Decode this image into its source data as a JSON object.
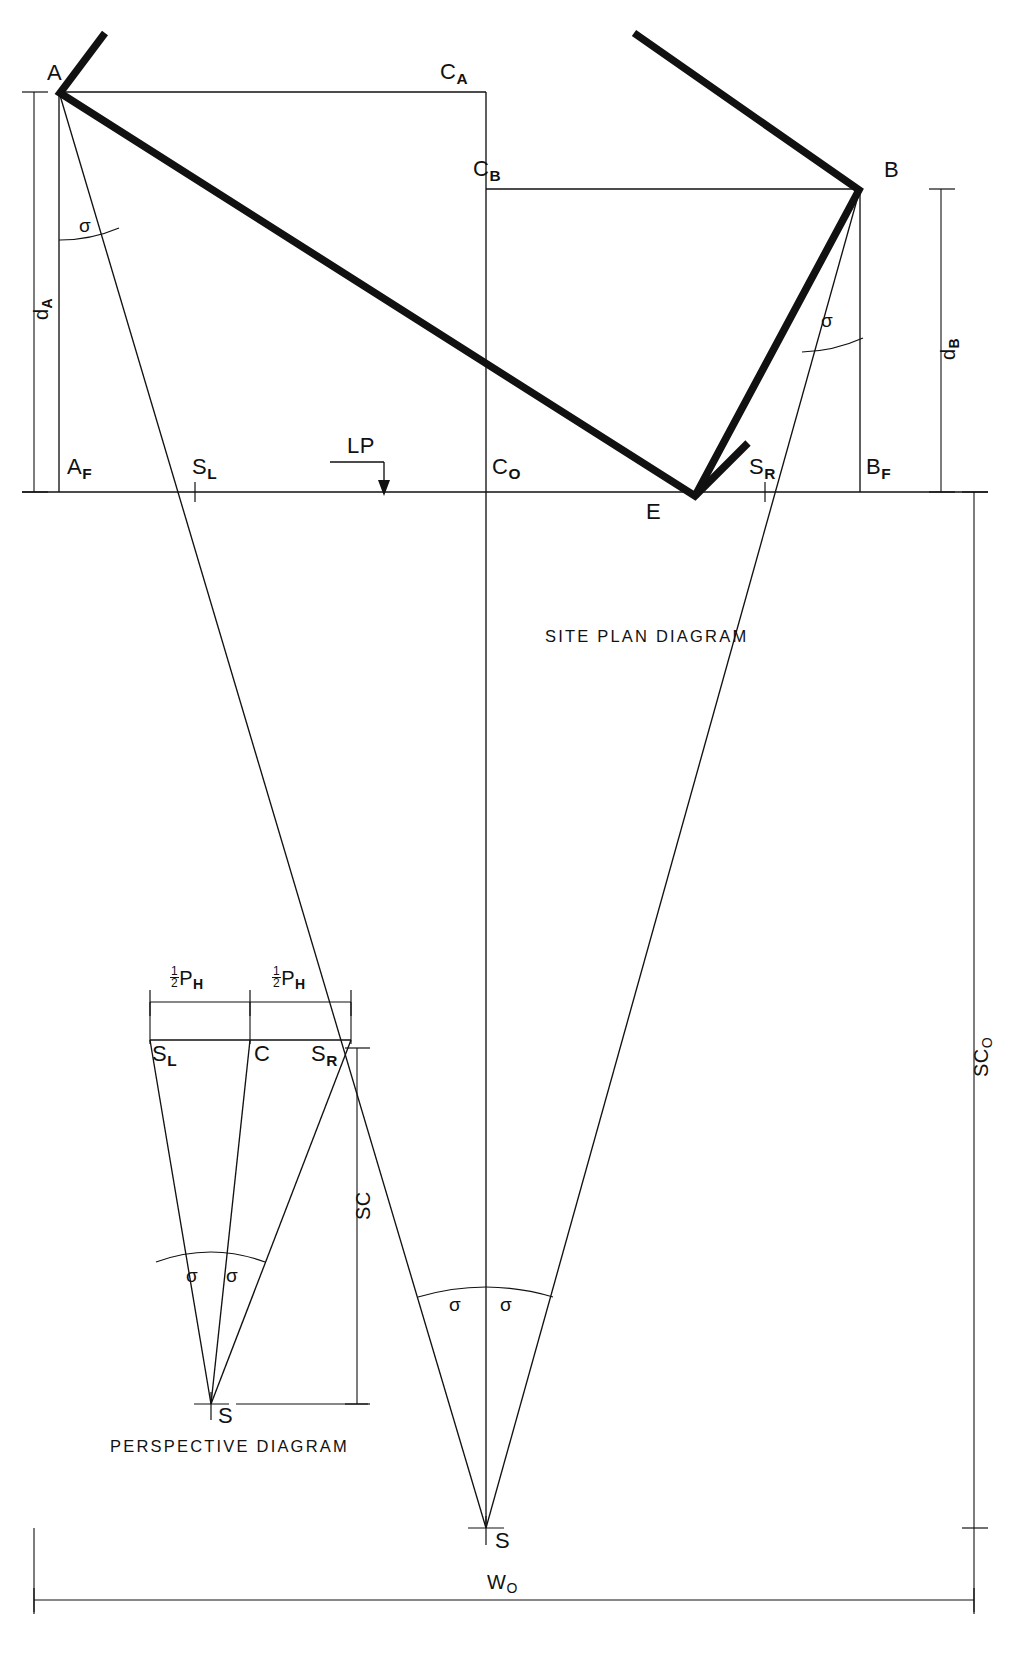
{
  "figure": {
    "type": "technical-drawing",
    "titles": {
      "site_plan": "SITE PLAN DIAGRAM",
      "perspective": "PERSPECTIVE DIAGRAM"
    },
    "ink_color": "#111111",
    "background_color": "#ffffff"
  },
  "site_plan": {
    "points": {
      "A": "A",
      "B": "B",
      "CA": "C",
      "CA_sub": "A",
      "CB": "C",
      "CB_sub": "B",
      "C0": "C",
      "C0_sub": "O",
      "E": "E",
      "AF": "A",
      "AF_sub": "F",
      "BF": "B",
      "BF_sub": "F",
      "SL": "S",
      "SL_sub": "L",
      "SR": "S",
      "SR_sub": "R",
      "S": "S"
    },
    "angles": {
      "sigma_at_A": "σ",
      "sigma_at_B": "σ",
      "sigma_left_at_S": "σ",
      "sigma_right_at_S": "σ"
    },
    "dimensions": {
      "dA": "d",
      "dA_sub": "A",
      "dB": "d",
      "dB_sub": "B",
      "SC0": "SC",
      "SC0_sub": "O",
      "W0": "W",
      "W0_sub": "O"
    },
    "annotations": {
      "lp": "LP"
    }
  },
  "perspective": {
    "points": {
      "SL": "S",
      "SL_sub": "L",
      "C": "C",
      "SR": "S",
      "SR_sub": "R",
      "S": "S"
    },
    "angles": {
      "sigma_left": "σ",
      "sigma_right": "σ"
    },
    "dimensions": {
      "half_PH_left_frac_num": "1",
      "half_PH_left_frac_den": "2",
      "half_PH_left_sym": "P",
      "half_PH_left_sub": "H",
      "half_PH_right_frac_num": "1",
      "half_PH_right_frac_den": "2",
      "half_PH_right_sym": "P",
      "half_PH_right_sub": "H",
      "SC": "SC"
    }
  }
}
